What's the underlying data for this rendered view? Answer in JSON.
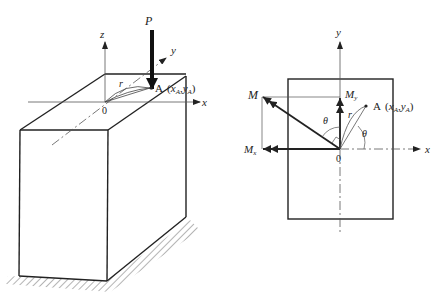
{
  "figure": {
    "left_panel": {
      "description": "Rectangular prism column fixed at base with eccentric axial load P at point A",
      "labels": {
        "force": "P",
        "axis_z": "z",
        "axis_y": "y",
        "axis_x": "x",
        "origin": "0",
        "radius": "r",
        "point_A": "A",
        "point_A_coords_open": "(",
        "xA": "x",
        "xA_sub": "A",
        "comma": ",",
        "yA": "y",
        "yA_sub": "A",
        "point_A_coords_close": ")"
      }
    },
    "right_panel": {
      "description": "Cross-section plan view showing resultant moment M and components Mx, My",
      "labels": {
        "axis_y": "y",
        "axis_x": "x",
        "origin": "0",
        "moment": "M",
        "moment_y": "M",
        "moment_y_sub": "y",
        "moment_x": "M",
        "moment_x_sub": "x",
        "radius": "r",
        "theta_left": "θ",
        "theta_right": "θ",
        "point_A": "A",
        "point_A_coords_open": "(",
        "xA": "x",
        "xA_sub": "A",
        "comma": ",",
        "yA": "y",
        "yA_sub": "A",
        "point_A_coords_close": ")"
      }
    },
    "colors": {
      "line": "#222222",
      "thin_line": "#555555",
      "background": "#ffffff"
    }
  }
}
